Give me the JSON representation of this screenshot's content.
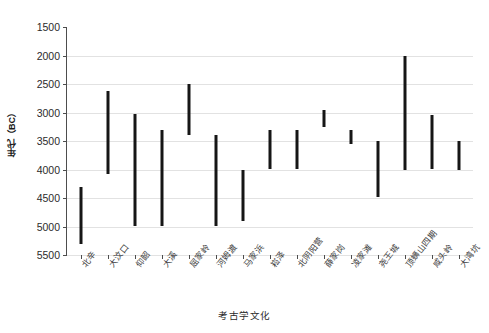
{
  "chart_data": {
    "type": "bar",
    "title": "",
    "subtitle": "",
    "xlabel": "考古学文化",
    "ylabel": "年代（BC）",
    "orientation": "vertical-range-bars",
    "grid": true,
    "legend": "none",
    "y_axis_inverted": true,
    "ylim": [
      1500,
      5500
    ],
    "yticks": [
      1500,
      2000,
      2500,
      3000,
      3500,
      4000,
      4500,
      5000,
      5500
    ],
    "ytick_labels": [
      "1500",
      "2000",
      "2500",
      "3000",
      "3500",
      "4000",
      "4500",
      "5000",
      "5500"
    ],
    "categories": [
      "北辛",
      "大汶口",
      "仰韶",
      "大溪",
      "屈家岭",
      "河姆渡",
      "马家浜",
      "崧泽",
      "北阴阳营",
      "薛家岗",
      "凌家滩",
      "尧王城",
      "顶蛳山四期",
      "咸头岭",
      "大湾坑"
    ],
    "series": [
      {
        "name": "年代范围",
        "color": "#161616",
        "ranges": [
          {
            "category": "北辛",
            "start": 4300,
            "end": 5300
          },
          {
            "category": "大汶口",
            "start": 2620,
            "end": 4080
          },
          {
            "category": "仰韶",
            "start": 3020,
            "end": 5000
          },
          {
            "category": "大溪",
            "start": 3300,
            "end": 5000
          },
          {
            "category": "屈家岭",
            "start": 2500,
            "end": 3400
          },
          {
            "category": "河姆渡",
            "start": 3400,
            "end": 5000
          },
          {
            "category": "马家浜",
            "start": 4000,
            "end": 4900
          },
          {
            "category": "崧泽",
            "start": 3300,
            "end": 4000
          },
          {
            "category": "北阴阳营",
            "start": 3300,
            "end": 4000
          },
          {
            "category": "薛家岗",
            "start": 2950,
            "end": 3250
          },
          {
            "category": "凌家滩",
            "start": 3300,
            "end": 3550
          },
          {
            "category": "尧王城",
            "start": 3500,
            "end": 4480
          },
          {
            "category": "顶蛳山四期",
            "start": 2000,
            "end": 4000
          },
          {
            "category": "咸头岭",
            "start": 3050,
            "end": 4000
          },
          {
            "category": "大湾坑",
            "start": 3500,
            "end": 4000
          }
        ]
      }
    ],
    "axis_color": "#4d4d4d",
    "grid_color": "#e2e2e2",
    "background": "#ffffff"
  }
}
